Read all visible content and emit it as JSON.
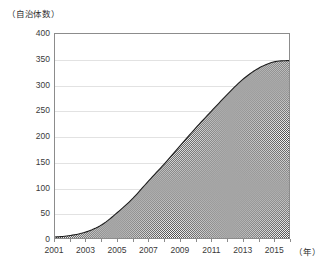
{
  "chart_data": {
    "type": "area",
    "title": "",
    "subtitle": "",
    "xlabel": "（年）",
    "ylabel": "（自治体数）",
    "grid": true,
    "legend": "none",
    "xlim": [
      2001,
      2016
    ],
    "ylim": [
      0,
      400
    ],
    "y_ticks": [
      400,
      350,
      300,
      250,
      200,
      150,
      100,
      50,
      0
    ],
    "y_tick_labels": [
      "400",
      "350",
      "300",
      "250",
      "200",
      "150",
      "100",
      "50",
      "0"
    ],
    "x_ticks": [
      2001,
      2003,
      2005,
      2007,
      2009,
      2011,
      2013,
      2015
    ],
    "x_tick_labels": [
      "2001",
      "2003",
      "2005",
      "2007",
      "2009",
      "2011",
      "2013",
      "2015"
    ],
    "x": [
      2001,
      2002,
      2003,
      2004,
      2005,
      2006,
      2007,
      2008,
      2009,
      2010,
      2011,
      2012,
      2013,
      2014,
      2015,
      2016
    ],
    "values": [
      2,
      5,
      12,
      26,
      50,
      78,
      112,
      145,
      180,
      215,
      248,
      280,
      310,
      332,
      345,
      348
    ],
    "series": [
      {
        "name": "自治体数",
        "values": [
          2,
          5,
          12,
          26,
          50,
          78,
          112,
          145,
          180,
          215,
          248,
          280,
          310,
          332,
          345,
          348
        ]
      }
    ],
    "colors": {
      "fill": "#6e6e6e",
      "line": "#1c1c1c",
      "grid": "#e2e2e2",
      "frame": "#8c8c8c",
      "text": "#3a3a3a"
    }
  },
  "axes": {
    "y_unit_label": "（自治体数）",
    "x_unit_label": "（年）"
  }
}
